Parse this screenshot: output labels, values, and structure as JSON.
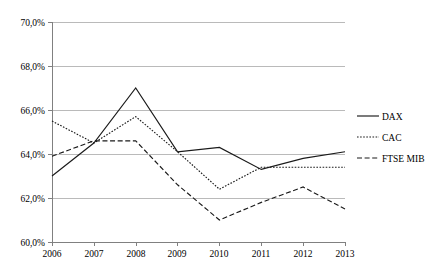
{
  "chart_data": {
    "type": "line",
    "title": "",
    "subtitle": "",
    "xlabel": "",
    "ylabel": "",
    "x": [
      2006,
      2007,
      2008,
      2009,
      2010,
      2011,
      2012,
      2013
    ],
    "categories": [
      "2006",
      "2007",
      "2008",
      "2009",
      "2010",
      "2011",
      "2012",
      "2013"
    ],
    "xtick_labels": [
      "2006",
      "2007",
      "2008",
      "2009",
      "2010",
      "2011",
      "2012",
      "2013"
    ],
    "ytick_labels": [
      "60,0%",
      "62,0%",
      "64,0%",
      "66,0%",
      "68,0%",
      "70,0%"
    ],
    "ytick_values": [
      60.0,
      62.0,
      64.0,
      66.0,
      68.0,
      70.0
    ],
    "ylim": [
      60.0,
      70.0
    ],
    "xlim": [
      2006,
      2013
    ],
    "grid": "horizontal",
    "legend_position": "right",
    "series": [
      {
        "name": "DAX",
        "style": "solid",
        "color": "#1a1a1a",
        "values": [
          63.0,
          64.5,
          67.0,
          64.1,
          64.3,
          63.3,
          63.8,
          64.1
        ]
      },
      {
        "name": "CAC",
        "style": "dotted",
        "color": "#1a1a1a",
        "values": [
          65.5,
          64.5,
          65.7,
          64.1,
          62.4,
          63.4,
          63.4,
          63.4
        ]
      },
      {
        "name": "FTSE MIB",
        "style": "dashed",
        "color": "#1a1a1a",
        "values": [
          63.9,
          64.6,
          64.6,
          62.6,
          61.0,
          61.8,
          62.5,
          61.5
        ]
      }
    ]
  },
  "legend": {
    "items": [
      {
        "label": "DAX"
      },
      {
        "label": "CAC"
      },
      {
        "label": "FTSE MIB"
      }
    ]
  },
  "axes": {
    "y": {
      "labels": [
        "70,0%",
        "68,0%",
        "66,0%",
        "64,0%",
        "62,0%",
        "60,0%"
      ]
    },
    "x": {
      "labels": [
        "2006",
        "2007",
        "2008",
        "2009",
        "2010",
        "2011",
        "2012",
        "2013"
      ]
    }
  },
  "colors": {
    "series": "#1a1a1a",
    "gridline": "#b3b3b3",
    "axis": "#808080",
    "background": "#ffffff"
  }
}
